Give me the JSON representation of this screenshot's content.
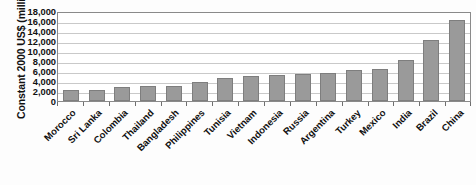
{
  "chart_data": {
    "type": "bar",
    "title": "",
    "subtitle": "",
    "xlabel": "",
    "ylabel": "Constant 2000 US$ (millions)",
    "ylim": [
      0,
      18000
    ],
    "ytick_labels": [
      "18,000",
      "16,000",
      "14,000",
      "12,000",
      "10,000",
      "8,000",
      "6,000",
      "4,000",
      "2,000",
      "0"
    ],
    "ytick_values": [
      18000,
      16000,
      14000,
      12000,
      10000,
      8000,
      6000,
      4000,
      2000,
      0
    ],
    "grid": true,
    "legend": false,
    "legend_position": "none",
    "bar_color": "#9a9a9a",
    "bar_edge_color": "#7e7e7e",
    "categories": [
      "Morocco",
      "Sri Lanka",
      "Colombia",
      "Thailand",
      "Bangladesh",
      "Philippines",
      "Tunisia",
      "Vietnam",
      "Indonesia",
      "Russia",
      "Argentina",
      "Turkey",
      "Mexico",
      "India",
      "Brazil",
      "China"
    ],
    "values": [
      2300,
      2250,
      2800,
      3050,
      3100,
      3800,
      4700,
      5100,
      5200,
      5400,
      5600,
      6200,
      6500,
      8200,
      12300,
      16300
    ]
  }
}
